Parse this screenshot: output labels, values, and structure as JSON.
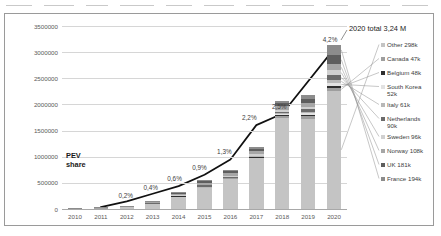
{
  "chart_data": {
    "type": "bar",
    "title": "",
    "subtitle": "",
    "xlabel": "",
    "ylabel": "",
    "categories": [
      "2010",
      "2011",
      "2012",
      "2013",
      "2014",
      "2015",
      "2016",
      "2017",
      "2018",
      "2019",
      "2020"
    ],
    "ylim": [
      0,
      3500000
    ],
    "ytick_values": [
      0,
      500000,
      1000000,
      1500000,
      2000000,
      2500000,
      3000000,
      3500000
    ],
    "ytick_labels": [
      "0",
      "500000",
      "1000000",
      "1500000",
      "2000000",
      "2500000",
      "3000000",
      "3500000"
    ],
    "grid": true,
    "legend_position": "right",
    "stacked": true,
    "series": [
      {
        "name": "France 194k",
        "color": "#8c8c8c",
        "values": [
          300,
          2600,
          5700,
          8800,
          12500,
          22900,
          27300,
          43000,
          45600,
          61000,
          194000
        ]
      },
      {
        "name": "UK 181k",
        "color": "#5e5e5e",
        "values": [
          200,
          1100,
          2900,
          3600,
          14500,
          28200,
          37900,
          47300,
          59900,
          77000,
          181000
        ]
      },
      {
        "name": "Norway 108k",
        "color": "#a6a6a6",
        "values": [
          400,
          2100,
          4400,
          8000,
          20000,
          34000,
          50000,
          62000,
          73000,
          79600,
          108000
        ]
      },
      {
        "name": "Sweden 96k",
        "color": "#d0d0d0",
        "values": [
          100,
          200,
          900,
          1500,
          4700,
          8500,
          13400,
          20300,
          29000,
          40000,
          96000
        ]
      },
      {
        "name": "Netherlands 90k",
        "color": "#6b6b6b",
        "values": [
          100,
          900,
          6200,
          22500,
          15000,
          43000,
          24000,
          10000,
          25000,
          67000,
          90000
        ]
      },
      {
        "name": "Italy 61k",
        "color": "#b8b8b8",
        "values": [
          100,
          200,
          500,
          900,
          1500,
          2300,
          3000,
          5000,
          10000,
          17000,
          61000
        ]
      },
      {
        "name": "South Korea 52k",
        "color": "#e2e2e2",
        "values": [
          100,
          300,
          800,
          1000,
          1300,
          3000,
          5000,
          14000,
          31000,
          35000,
          52000
        ]
      },
      {
        "name": "Belgium 48k",
        "color": "#2e2e2e",
        "values": [
          100,
          300,
          600,
          900,
          1400,
          2300,
          3500,
          5500,
          8800,
          15000,
          48000
        ]
      },
      {
        "name": "Canada 47k",
        "color": "#9e9e9e",
        "values": [
          100,
          500,
          1900,
          2800,
          5100,
          6800,
          11200,
          18600,
          44000,
          51000,
          47000
        ]
      },
      {
        "name": "Other 298k",
        "color": "#c4c4c4",
        "values": [
          1500,
          12000,
          35000,
          95000,
          240000,
          400000,
          580000,
          970000,
          1740000,
          1730000,
          2263000
        ]
      }
    ],
    "totals": [
      3000,
      20000,
      59000,
      145000,
      316000,
      551000,
      755000,
      1196000,
      2066000,
      2173000,
      3240000
    ],
    "line_series": {
      "name": "PEV share",
      "unit": "%",
      "color": "#111111",
      "labels": [
        "",
        "",
        "0,2%",
        "0,4%",
        "0,6%",
        "0,9%",
        "1,3%",
        "2,2%",
        "2,5%",
        "4,2%"
      ],
      "points": [
        {
          "year": "2012",
          "label": "0,2%",
          "value": 0.2
        },
        {
          "year": "2013",
          "label": "0,4%",
          "value": 0.4
        },
        {
          "year": "2014",
          "label": "0,6%",
          "value": 0.6
        },
        {
          "year": "2015",
          "label": "0,9%",
          "value": 0.9
        },
        {
          "year": "2016",
          "label": "1,3%",
          "value": 1.3
        },
        {
          "year": "2017",
          "label": "2,2%",
          "value": 2.2
        },
        {
          "year": "2018",
          "label": "2,5%",
          "value": 2.5
        },
        {
          "year": "2020",
          "label": "4,2%",
          "value": 4.2
        }
      ]
    },
    "annotations": {
      "pev_share_line1": "PEV",
      "pev_share_line2": "share",
      "total_2020": "2020 total 3,24 M"
    }
  },
  "legend": {
    "items": [
      {
        "label": "Other 298k",
        "color": "#c4c4c4"
      },
      {
        "label": "Canada 47k",
        "color": "#9e9e9e"
      },
      {
        "label": "Belgium 48k",
        "color": "#2e2e2e"
      },
      {
        "label": "South Korea\n52k",
        "color": "#e2e2e2"
      },
      {
        "label": "Italy 61k",
        "color": "#b8b8b8"
      },
      {
        "label": "Netherlands\n90k",
        "color": "#6b6b6b"
      },
      {
        "label": "Sweden 96k",
        "color": "#d0d0d0"
      },
      {
        "label": "Norway 108k",
        "color": "#a6a6a6"
      },
      {
        "label": "UK 181k",
        "color": "#5e5e5e"
      },
      {
        "label": "France 194k",
        "color": "#8c8c8c"
      }
    ]
  }
}
